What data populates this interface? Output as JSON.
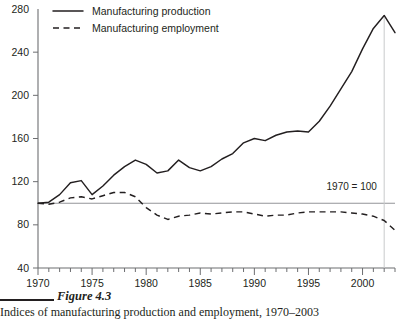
{
  "figure": {
    "caption_label": "Figure 4.3",
    "caption_sub": "Indices of manufacturing production and employment, 1970–2003"
  },
  "annotation": {
    "base_note": "1970 = 100"
  },
  "legend": {
    "position": "top-left",
    "items": [
      {
        "label": "Manufacturing production",
        "style": "solid",
        "color": "#231f20"
      },
      {
        "label": "Manufacturing employment",
        "style": "dashed",
        "color": "#231f20"
      }
    ]
  },
  "axes": {
    "y_ticks": [
      280,
      240,
      200,
      160,
      120,
      80,
      40
    ],
    "x_ticks": [
      1970,
      1975,
      1980,
      1985,
      1990,
      1995,
      2000
    ],
    "x_minor_step": 1
  },
  "chart_data": {
    "type": "line",
    "title": "",
    "subtitle": "",
    "xlabel": "",
    "ylabel": "",
    "xlim": [
      1970,
      2003
    ],
    "ylim": [
      40,
      280
    ],
    "grid": false,
    "legend_position": "top-left",
    "annotations": [
      {
        "text": "1970 = 100",
        "x": 1999,
        "y": 112
      },
      {
        "text": "reference line at index 100",
        "x": null,
        "y": 100
      }
    ],
    "x": [
      1970,
      1971,
      1972,
      1973,
      1974,
      1975,
      1976,
      1977,
      1978,
      1979,
      1980,
      1981,
      1982,
      1983,
      1984,
      1985,
      1986,
      1987,
      1988,
      1989,
      1990,
      1991,
      1992,
      1993,
      1994,
      1995,
      1996,
      1997,
      1998,
      1999,
      2000,
      2001,
      2002,
      2003
    ],
    "series": [
      {
        "name": "Manufacturing production",
        "style": "solid",
        "color": "#231f20",
        "values": [
          100,
          101,
          108,
          119,
          121,
          108,
          116,
          126,
          134,
          140,
          136,
          128,
          130,
          140,
          133,
          130,
          134,
          141,
          146,
          156,
          160,
          158,
          163,
          166,
          167,
          166,
          176,
          190,
          206,
          222,
          243,
          262,
          274,
          258
        ]
      },
      {
        "name": "Manufacturing employment",
        "style": "dashed",
        "color": "#231f20",
        "values": [
          100,
          99,
          101,
          105,
          106,
          104,
          107,
          110,
          110,
          106,
          96,
          89,
          85,
          88,
          89,
          91,
          90,
          91,
          92,
          92,
          90,
          88,
          89,
          89,
          91,
          92,
          92,
          92,
          92,
          91,
          90,
          88,
          84,
          75
        ]
      }
    ]
  }
}
